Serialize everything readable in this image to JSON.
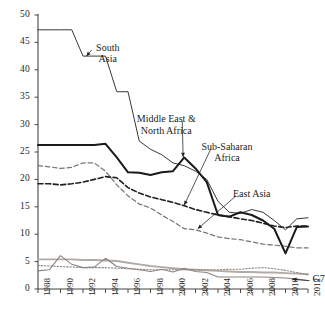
{
  "chart_data": {
    "type": "line",
    "title": "",
    "subtitle": "",
    "xlabel": "",
    "ylabel": "",
    "xlim": [
      1988,
      2012
    ],
    "ylim": [
      0,
      50
    ],
    "ytick_values": [
      0,
      5,
      10,
      15,
      20,
      25,
      30,
      35,
      40,
      45,
      50
    ],
    "ytick_labels": [
      "0",
      "5",
      "10",
      "15",
      "20",
      "25",
      "30",
      "35",
      "40",
      "45",
      "50"
    ],
    "xtick_values": [
      1988,
      1990,
      1992,
      1994,
      1996,
      1998,
      2000,
      2002,
      2004,
      2006,
      2008,
      2010,
      2012
    ],
    "xtick_labels": [
      "1988",
      "1990",
      "1992",
      "1994",
      "1996",
      "1998",
      "2000",
      "2002",
      "2004",
      "2006",
      "2008",
      "2010",
      "2012"
    ],
    "minor_xticks_every": 1,
    "grid": false,
    "legend": "inline-annotations",
    "x": [
      1988,
      1989,
      1990,
      1991,
      1992,
      1993,
      1994,
      1995,
      1996,
      1997,
      1998,
      1999,
      2000,
      2001,
      2002,
      2003,
      2004,
      2005,
      2006,
      2007,
      2008,
      2009,
      2010,
      2011,
      2012
    ],
    "series": [
      {
        "name": "South Asia",
        "style": "solid-thin",
        "color": "#3b3733",
        "values": [
          47.3,
          47.3,
          47.3,
          47.3,
          42.5,
          42.5,
          42.5,
          36.0,
          36.0,
          27.0,
          25.5,
          24.5,
          23.0,
          22.5,
          21.5,
          20.0,
          16.0,
          14.0,
          13.8,
          14.5,
          14.0,
          12.5,
          10.8,
          12.8,
          13.0
        ]
      },
      {
        "name": "Middle East & North Africa",
        "style": "solid-thick",
        "color": "#1c1a18",
        "values": [
          26.3,
          26.3,
          26.3,
          26.3,
          26.3,
          26.3,
          26.5,
          24.0,
          21.3,
          21.2,
          20.8,
          21.3,
          21.5,
          24.0,
          22.0,
          19.5,
          13.5,
          13.2,
          14.0,
          13.5,
          12.5,
          11.0,
          6.5,
          11.3,
          11.4
        ]
      },
      {
        "name": "Sub-Saharan Africa",
        "style": "dashed-dark",
        "color": "#231f20",
        "values": [
          19.2,
          19.2,
          19.0,
          19.2,
          19.5,
          20.0,
          20.5,
          20.3,
          18.5,
          17.5,
          16.8,
          16.3,
          15.8,
          15.2,
          14.5,
          14.0,
          13.5,
          13.2,
          12.8,
          12.5,
          12.0,
          11.5,
          11.2,
          11.5,
          11.5
        ]
      },
      {
        "name": "East Asia",
        "style": "dashed-light",
        "color": "#7a736d",
        "values": [
          22.5,
          22.3,
          22.0,
          22.2,
          23.0,
          23.0,
          21.5,
          19.0,
          17.0,
          15.5,
          14.8,
          13.5,
          12.3,
          11.0,
          10.8,
          10.2,
          9.5,
          9.2,
          9.0,
          8.6,
          8.2,
          8.0,
          7.8,
          7.5,
          7.5
        ]
      },
      {
        "name": "G7",
        "style": "solid-gray",
        "color": "#8a8580",
        "values": [
          3.3,
          3.5,
          6.1,
          4.5,
          3.9,
          4.0,
          5.6,
          4.1,
          3.8,
          3.5,
          3.2,
          3.6,
          3.1,
          3.8,
          3.2,
          3.0,
          2.2,
          2.2,
          2.2,
          2.2,
          2.2,
          2.1,
          2.0,
          1.8,
          1.5
        ]
      },
      {
        "name": "reference-flat-gray",
        "style": "solid-gray-flat",
        "color": "#b0aba6",
        "values": [
          5.4,
          5.4,
          5.4,
          5.4,
          5.3,
          5.3,
          5.2,
          5.1,
          4.8,
          4.5,
          4.2,
          4.0,
          3.8,
          3.6,
          3.5,
          3.4,
          3.3,
          3.2,
          3.1,
          3.1,
          3.0,
          3.0,
          2.9,
          2.8,
          2.7
        ]
      },
      {
        "name": "reference-dotted",
        "style": "dotted-gray",
        "color": "#8a8580",
        "values": [
          4.3,
          4.2,
          4.1,
          4.0,
          3.9,
          3.9,
          3.9,
          3.8,
          3.7,
          3.6,
          3.5,
          3.5,
          3.5,
          3.5,
          3.5,
          3.5,
          3.5,
          3.6,
          3.6,
          3.8,
          3.9,
          3.7,
          3.4,
          3.0,
          2.6
        ]
      }
    ],
    "annotations": [
      {
        "name": "south-asia-label",
        "text_lines": [
          "South",
          "Asia"
        ],
        "x": 1994.2,
        "y": 44.0,
        "arrow_to_x": 1992.3,
        "arrow_to_y": 42.5
      },
      {
        "name": "mena-label",
        "text_lines": [
          "Middle East &",
          "North Africa"
        ],
        "x": 1999.4,
        "y": 31.0,
        "arrow_to_x": 2000.9,
        "arrow_to_y": 24.1
      },
      {
        "name": "sub-saharan-africa-label",
        "text_lines": [
          "Sub-Saharan",
          "Africa"
        ],
        "x": 2004.8,
        "y": 26.0,
        "arrow_to_x": 2001.0,
        "arrow_to_y": 15.3
      },
      {
        "name": "east-asia-label",
        "text_lines": [
          "East Asia"
        ],
        "x": 2007.0,
        "y": 17.3,
        "arrow_to_x": 2002.2,
        "arrow_to_y": 11.0
      },
      {
        "name": "g7-label",
        "text_lines": [
          "G7"
        ],
        "x": 2012.4,
        "y": 1.9,
        "arrow_to_x": 2010.6,
        "arrow_to_y": 1.8
      }
    ]
  }
}
